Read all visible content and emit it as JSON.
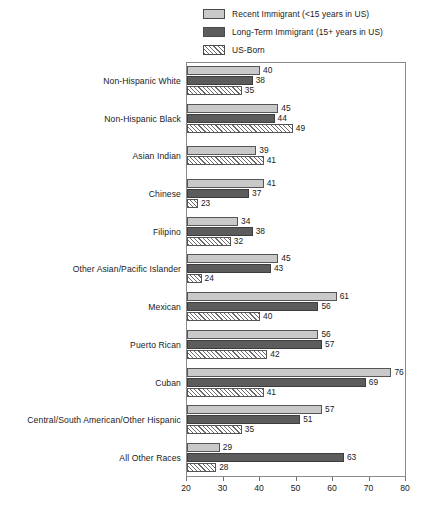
{
  "legend": {
    "items": [
      {
        "label": "Recent Immigrant (<15 years in US)",
        "swatch": "light-gray-square-icon"
      },
      {
        "label": "Long-Term Immigrant (15+ years in US)",
        "swatch": "dark-gray-square-icon"
      },
      {
        "label": "US-Born",
        "swatch": "hatched-square-icon"
      }
    ]
  },
  "chart_data": {
    "type": "bar",
    "orientation": "horizontal",
    "title": "",
    "xlabel": "",
    "ylabel": "",
    "xlim": [
      20,
      80
    ],
    "xticks": [
      20,
      30,
      40,
      50,
      60,
      70,
      80
    ],
    "grid": false,
    "legend_position": "top",
    "categories": [
      "Non-Hispanic White",
      "Non-Hispanic Black",
      "Asian Indian",
      "Chinese",
      "Filipino",
      "Other Asian/Pacific Islander",
      "Mexican",
      "Puerto Rican",
      "Cuban",
      "Central/South American/Other Hispanic",
      "All Other Races"
    ],
    "series": [
      {
        "name": "Recent Immigrant (<15 years in US)",
        "values": [
          40,
          45,
          39,
          41,
          34,
          45,
          61,
          56,
          76,
          57,
          29
        ]
      },
      {
        "name": "Long-Term Immigrant (15+ years in US)",
        "values": [
          38,
          44,
          null,
          37,
          38,
          43,
          56,
          57,
          69,
          51,
          63
        ]
      },
      {
        "name": "US-Born",
        "values": [
          35,
          49,
          41,
          23,
          32,
          24,
          40,
          42,
          41,
          35,
          28
        ]
      }
    ]
  }
}
